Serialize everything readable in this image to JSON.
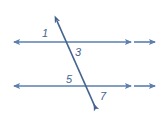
{
  "diagram": {
    "type": "geometry-figure",
    "stroke_color": "#5a7fae",
    "label_color": "#44648f",
    "background_color": "#ffffff",
    "lines": [
      {
        "name": "top-parallel-line",
        "orientation": "horizontal",
        "y": 42,
        "x_start": 10,
        "x_end": 157,
        "arrowheads": [
          "left",
          "right-inner",
          "right-outer"
        ]
      },
      {
        "name": "bottom-parallel-line",
        "orientation": "horizontal",
        "y": 86,
        "x_start": 10,
        "x_end": 157,
        "arrowheads": [
          "left",
          "right-inner",
          "right-outer"
        ]
      },
      {
        "name": "transversal-line",
        "orientation": "oblique",
        "x_start": 55,
        "y_start": 17,
        "x_end": 98,
        "y_end": 113,
        "arrowheads": [
          "start",
          "end"
        ]
      }
    ],
    "intersections": [
      {
        "name": "upper-intersection",
        "x": 70,
        "y": 42
      },
      {
        "name": "lower-intersection",
        "x": 85,
        "y": 86
      }
    ],
    "labels": [
      {
        "id": "angle-1",
        "text": "1",
        "x": 45,
        "y": 37,
        "position": "upper-left-of-upper-intersection"
      },
      {
        "id": "angle-3",
        "text": "3",
        "x": 77,
        "y": 56,
        "position": "lower-right-of-upper-intersection"
      },
      {
        "id": "angle-5",
        "text": "5",
        "x": 68,
        "y": 83,
        "position": "upper-left-of-lower-intersection"
      },
      {
        "id": "angle-7",
        "text": "7",
        "x": 101,
        "y": 100,
        "position": "lower-right-of-lower-intersection"
      }
    ]
  }
}
